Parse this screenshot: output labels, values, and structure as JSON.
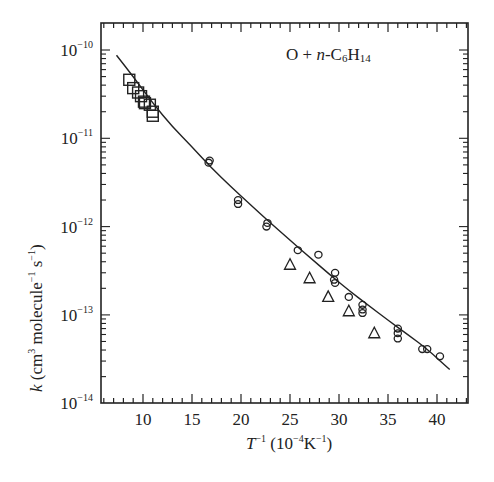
{
  "chart_data": {
    "type": "scatter",
    "title": "O + n-C6H14",
    "annotation": {
      "prefix": "O + ",
      "italic": "n",
      "rest": "-C",
      "sub1": "6",
      "h": "H",
      "sub2": "14"
    },
    "xlabel": "T^-1 (10^-4 K^-1)",
    "ylabel": "k (cm^3 molecule^-1 s^-1)",
    "xscale": "linear",
    "yscale": "log",
    "xlim": [
      5.7,
      43.2
    ],
    "ylim": [
      1e-14,
      1.9e-10
    ],
    "x_ticks": [
      10,
      15,
      20,
      25,
      30,
      35,
      40
    ],
    "y_ticks": [
      "10^-10",
      "10^-11",
      "10^-12",
      "10^-13",
      "10^-14"
    ],
    "grid": false,
    "series": [
      {
        "name": "squares",
        "marker": "square",
        "points": [
          [
            8.6,
            4.6e-11
          ],
          [
            9.0,
            3.7e-11
          ],
          [
            9.5,
            3.3e-11
          ],
          [
            9.8,
            3e-11
          ],
          [
            10.2,
            2.5e-11
          ],
          [
            10.1,
            2.6e-11
          ],
          [
            10.7,
            2.4e-11
          ],
          [
            11.0,
            2e-11
          ],
          [
            11.0,
            1.8e-11
          ]
        ]
      },
      {
        "name": "circles",
        "marker": "circle",
        "points": [
          [
            16.7,
            5.3e-12
          ],
          [
            16.8,
            5.6e-12
          ],
          [
            19.7,
            2e-12
          ],
          [
            19.7,
            1.8e-12
          ],
          [
            22.7,
            1.1e-12
          ],
          [
            22.6,
            1e-12
          ],
          [
            25.8,
            5.4e-13
          ],
          [
            27.9,
            4.8e-13
          ],
          [
            29.6,
            3e-13
          ],
          [
            29.5,
            2.5e-13
          ],
          [
            29.6,
            2.3e-13
          ],
          [
            31.0,
            1.6e-13
          ],
          [
            32.4,
            1.3e-13
          ],
          [
            32.4,
            1.15e-13
          ],
          [
            32.4,
            1.05e-13
          ],
          [
            36.0,
            7e-14
          ],
          [
            36.0,
            6.2e-14
          ],
          [
            36.0,
            5.4e-14
          ],
          [
            38.5,
            4.1e-14
          ],
          [
            39.0,
            4.1e-14
          ],
          [
            40.3,
            3.4e-14
          ]
        ]
      },
      {
        "name": "triangles",
        "marker": "triangle",
        "points": [
          [
            25.0,
            3.7e-13
          ],
          [
            27.0,
            2.6e-13
          ],
          [
            28.9,
            1.6e-13
          ],
          [
            31.0,
            1.1e-13
          ],
          [
            33.6,
            6.2e-14
          ]
        ]
      },
      {
        "name": "fit",
        "marker": "line",
        "points": [
          [
            7.3,
            8.7e-11
          ],
          [
            9.0,
            5e-11
          ],
          [
            11.0,
            2.5e-11
          ],
          [
            13.0,
            1.35e-11
          ],
          [
            15.0,
            8e-12
          ],
          [
            17.0,
            4.6e-12
          ],
          [
            19.0,
            2.8e-12
          ],
          [
            21.0,
            1.75e-12
          ],
          [
            23.0,
            1.1e-12
          ],
          [
            25.0,
            7e-13
          ],
          [
            27.0,
            4.5e-13
          ],
          [
            29.0,
            2.9e-13
          ],
          [
            31.0,
            1.9e-13
          ],
          [
            33.0,
            1.28e-13
          ],
          [
            35.0,
            8.7e-14
          ],
          [
            37.0,
            6e-14
          ],
          [
            39.0,
            4.1e-14
          ],
          [
            41.3,
            2.4e-14
          ]
        ]
      }
    ]
  },
  "axes": {
    "x_tick_labels": [
      "10",
      "15",
      "20",
      "25",
      "30",
      "35",
      "40"
    ],
    "y_tick_labels": [
      {
        "base": "10",
        "exp": "−10"
      },
      {
        "base": "10",
        "exp": "−11"
      },
      {
        "base": "10",
        "exp": "−12"
      },
      {
        "base": "10",
        "exp": "−13"
      },
      {
        "base": "10",
        "exp": "−14"
      }
    ],
    "xlabel_parts": {
      "T": "T",
      "exp1": "−1",
      "paren_open": " (10",
      "exp2": "−4",
      "K": "K",
      "exp3": "−1",
      "paren_close": ")"
    },
    "ylabel_parts": {
      "k": "k",
      "open": " (cm",
      "exp1": "3",
      "mid": " molecule",
      "exp2": "−1",
      "s": " s",
      "exp3": "−1",
      "close": ")"
    }
  },
  "colors": {
    "ink": "#222222",
    "background": "#ffffff"
  }
}
